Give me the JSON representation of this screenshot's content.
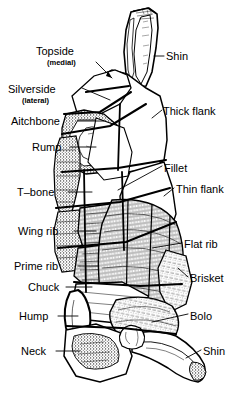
{
  "diagram": {
    "ink_color": "#000000",
    "background_color": "#ffffff",
    "labels_left": [
      {
        "id": "topside",
        "text": "Topside",
        "sub": "(medial)",
        "x": 36,
        "y": 45,
        "sub_x": 47,
        "sub_y": 58,
        "leader": "arrow"
      },
      {
        "id": "silverside",
        "text": "Silverside",
        "sub": "(lateral)",
        "x": 8,
        "y": 83,
        "sub_x": 22,
        "sub_y": 96,
        "leader": "line"
      },
      {
        "id": "aitchbone",
        "text": "Aitchbone",
        "sub": "",
        "x": 11,
        "y": 115,
        "sub_x": 0,
        "sub_y": 0,
        "leader": "line"
      },
      {
        "id": "rump",
        "text": "Rump",
        "sub": "",
        "x": 32,
        "y": 141,
        "sub_x": 0,
        "sub_y": 0,
        "leader": "line"
      },
      {
        "id": "t-bone",
        "text": "T–bone",
        "sub": "",
        "x": 17,
        "y": 186,
        "sub_x": 0,
        "sub_y": 0,
        "leader": "line"
      },
      {
        "id": "wing-rib",
        "text": "Wing rib",
        "sub": "",
        "x": 18,
        "y": 225,
        "sub_x": 0,
        "sub_y": 0,
        "leader": "line"
      },
      {
        "id": "prime-rib",
        "text": "Prime rib",
        "sub": "",
        "x": 14,
        "y": 260,
        "sub_x": 0,
        "sub_y": 0,
        "leader": "line"
      },
      {
        "id": "chuck",
        "text": "Chuck",
        "sub": "",
        "x": 28,
        "y": 281,
        "sub_x": 0,
        "sub_y": 0,
        "leader": "line"
      },
      {
        "id": "hump",
        "text": "Hump",
        "sub": "",
        "x": 19,
        "y": 310,
        "sub_x": 0,
        "sub_y": 0,
        "leader": "line"
      },
      {
        "id": "neck",
        "text": "Neck",
        "sub": "",
        "x": 21,
        "y": 345,
        "sub_x": 0,
        "sub_y": 0,
        "leader": "line"
      }
    ],
    "labels_right": [
      {
        "id": "shin-hind",
        "text": "Shin",
        "x": 166,
        "y": 50,
        "leader": "line"
      },
      {
        "id": "thick-flank",
        "text": "Thick flank",
        "x": 163,
        "y": 105,
        "leader": "line"
      },
      {
        "id": "fillet",
        "text": "Fillet",
        "x": 164,
        "y": 162,
        "leader": "line"
      },
      {
        "id": "thin-flank",
        "text": "Thin flank",
        "x": 176,
        "y": 183,
        "leader": "line"
      },
      {
        "id": "flat-rib",
        "text": "Flat rib",
        "x": 184,
        "y": 238,
        "leader": "line"
      },
      {
        "id": "brisket",
        "text": "Brisket",
        "x": 190,
        "y": 272,
        "leader": "line"
      },
      {
        "id": "bolo",
        "text": "Bolo",
        "x": 190,
        "y": 310,
        "leader": "line"
      },
      {
        "id": "shin-fore",
        "text": "Shin",
        "x": 203,
        "y": 345,
        "leader": "line"
      }
    ]
  }
}
